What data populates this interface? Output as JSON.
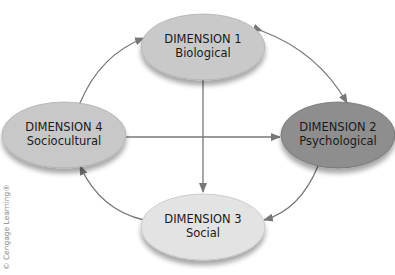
{
  "diagram": {
    "nodes": [
      {
        "id": "dim1",
        "title": "DIMENSION 1",
        "subtitle": "Biological",
        "fill": "#c9c9c9",
        "cx": 203,
        "cy": 47,
        "rx": 62,
        "ry": 33
      },
      {
        "id": "dim2",
        "title": "DIMENSION 2",
        "subtitle": "Psychological",
        "fill": "#8e8e8e",
        "cx": 338,
        "cy": 135,
        "rx": 57,
        "ry": 33
      },
      {
        "id": "dim3",
        "title": "DIMENSION 3",
        "subtitle": "Social",
        "fill": "#e3e3e3",
        "cx": 203,
        "cy": 227,
        "rx": 62,
        "ry": 33
      },
      {
        "id": "dim4",
        "title": "DIMENSION 4",
        "subtitle": "Sociocultural",
        "fill": "#c8c8c8",
        "cx": 64,
        "cy": 135,
        "rx": 62,
        "ry": 33
      }
    ],
    "edges": [
      {
        "from": "dim1",
        "to": "dim2",
        "style": "curved",
        "bidirectional": true
      },
      {
        "from": "dim2",
        "to": "dim3",
        "style": "curved",
        "bidirectional": true
      },
      {
        "from": "dim3",
        "to": "dim4",
        "style": "curved",
        "bidirectional": true
      },
      {
        "from": "dim4",
        "to": "dim1",
        "style": "curved",
        "bidirectional": true
      },
      {
        "from": "dim1",
        "to": "dim3",
        "style": "straight",
        "bidirectional": true
      },
      {
        "from": "dim4",
        "to": "dim2",
        "style": "straight",
        "bidirectional": true
      }
    ],
    "arrow_color": "#777777",
    "credit": "© Cengage Learning®"
  }
}
